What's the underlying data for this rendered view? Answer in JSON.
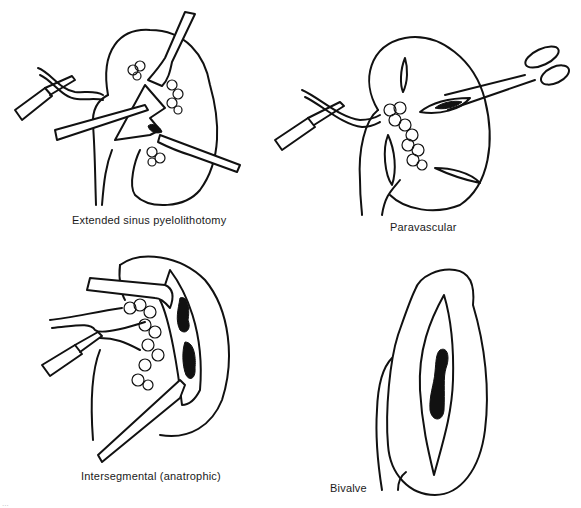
{
  "figure": {
    "panels": [
      {
        "id": "extended-sinus",
        "label": "Extended sinus pyelolithotomy"
      },
      {
        "id": "paravascular",
        "label": "Paravascular"
      },
      {
        "id": "intersegmental",
        "label": "Intersegmental (anatrophic)"
      },
      {
        "id": "bivalve",
        "label": "Bivalve"
      }
    ],
    "caption_fragment": "...",
    "colors": {
      "ink": "#111111",
      "background": "#ffffff"
    }
  }
}
